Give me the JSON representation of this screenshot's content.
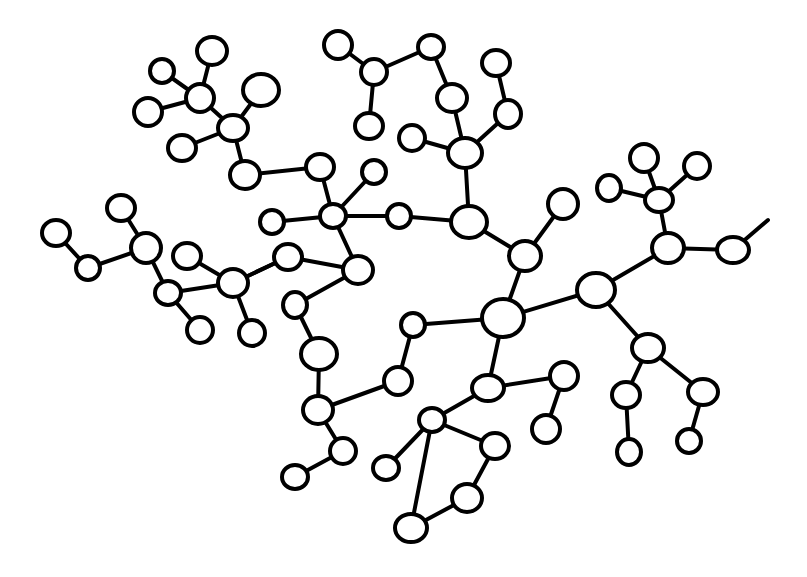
{
  "diagram": {
    "type": "hand-drawn network graph",
    "background": "#ffffff",
    "stroke_color": "#000000",
    "nodes": [
      {
        "id": 0,
        "x": 503,
        "y": 318,
        "rx": 21,
        "ry": 19
      },
      {
        "id": 1,
        "x": 596,
        "y": 290,
        "rx": 19,
        "ry": 17
      },
      {
        "id": 2,
        "x": 525,
        "y": 256,
        "rx": 16,
        "ry": 15
      },
      {
        "id": 3,
        "x": 469,
        "y": 222,
        "rx": 18,
        "ry": 16
      },
      {
        "id": 4,
        "x": 465,
        "y": 153,
        "rx": 17,
        "ry": 15
      },
      {
        "id": 5,
        "x": 452,
        "y": 98,
        "rx": 15,
        "ry": 14
      },
      {
        "id": 6,
        "x": 431,
        "y": 47,
        "rx": 13,
        "ry": 12
      },
      {
        "id": 7,
        "x": 508,
        "y": 114,
        "rx": 13,
        "ry": 14
      },
      {
        "id": 8,
        "x": 496,
        "y": 63,
        "rx": 14,
        "ry": 13
      },
      {
        "id": 9,
        "x": 412,
        "y": 138,
        "rx": 13,
        "ry": 13
      },
      {
        "id": 10,
        "x": 563,
        "y": 204,
        "rx": 15,
        "ry": 15
      },
      {
        "id": 11,
        "x": 374,
        "y": 72,
        "rx": 13,
        "ry": 13
      },
      {
        "id": 12,
        "x": 338,
        "y": 45,
        "rx": 14,
        "ry": 14
      },
      {
        "id": 13,
        "x": 369,
        "y": 126,
        "rx": 14,
        "ry": 13
      },
      {
        "id": 14,
        "x": 399,
        "y": 216,
        "rx": 12,
        "ry": 12
      },
      {
        "id": 15,
        "x": 333,
        "y": 216,
        "rx": 13,
        "ry": 12
      },
      {
        "id": 16,
        "x": 374,
        "y": 172,
        "rx": 12,
        "ry": 12
      },
      {
        "id": 17,
        "x": 320,
        "y": 167,
        "rx": 14,
        "ry": 13
      },
      {
        "id": 18,
        "x": 245,
        "y": 175,
        "rx": 15,
        "ry": 14
      },
      {
        "id": 19,
        "x": 233,
        "y": 128,
        "rx": 15,
        "ry": 13
      },
      {
        "id": 20,
        "x": 200,
        "y": 98,
        "rx": 14,
        "ry": 14
      },
      {
        "id": 21,
        "x": 212,
        "y": 51,
        "rx": 15,
        "ry": 14
      },
      {
        "id": 22,
        "x": 162,
        "y": 71,
        "rx": 12,
        "ry": 12
      },
      {
        "id": 23,
        "x": 148,
        "y": 112,
        "rx": 14,
        "ry": 14
      },
      {
        "id": 24,
        "x": 182,
        "y": 148,
        "rx": 14,
        "ry": 13
      },
      {
        "id": 25,
        "x": 261,
        "y": 90,
        "rx": 18,
        "ry": 16
      },
      {
        "id": 26,
        "x": 272,
        "y": 222,
        "rx": 12,
        "ry": 12
      },
      {
        "id": 27,
        "x": 358,
        "y": 270,
        "rx": 15,
        "ry": 14
      },
      {
        "id": 28,
        "x": 288,
        "y": 257,
        "rx": 14,
        "ry": 13
      },
      {
        "id": 29,
        "x": 233,
        "y": 283,
        "rx": 15,
        "ry": 14
      },
      {
        "id": 30,
        "x": 295,
        "y": 305,
        "rx": 12,
        "ry": 13
      },
      {
        "id": 31,
        "x": 319,
        "y": 354,
        "rx": 18,
        "ry": 16
      },
      {
        "id": 32,
        "x": 318,
        "y": 410,
        "rx": 15,
        "ry": 14
      },
      {
        "id": 33,
        "x": 398,
        "y": 381,
        "rx": 14,
        "ry": 14
      },
      {
        "id": 34,
        "x": 413,
        "y": 325,
        "rx": 12,
        "ry": 12
      },
      {
        "id": 35,
        "x": 343,
        "y": 451,
        "rx": 13,
        "ry": 13
      },
      {
        "id": 36,
        "x": 295,
        "y": 477,
        "rx": 13,
        "ry": 12
      },
      {
        "id": 37,
        "x": 488,
        "y": 388,
        "rx": 16,
        "ry": 13
      },
      {
        "id": 38,
        "x": 564,
        "y": 376,
        "rx": 14,
        "ry": 14
      },
      {
        "id": 39,
        "x": 546,
        "y": 429,
        "rx": 14,
        "ry": 14
      },
      {
        "id": 40,
        "x": 432,
        "y": 420,
        "rx": 13,
        "ry": 12
      },
      {
        "id": 41,
        "x": 495,
        "y": 446,
        "rx": 14,
        "ry": 13
      },
      {
        "id": 42,
        "x": 467,
        "y": 498,
        "rx": 15,
        "ry": 14
      },
      {
        "id": 43,
        "x": 411,
        "y": 528,
        "rx": 16,
        "ry": 14
      },
      {
        "id": 44,
        "x": 386,
        "y": 468,
        "rx": 13,
        "ry": 12
      },
      {
        "id": 45,
        "x": 648,
        "y": 348,
        "rx": 16,
        "ry": 14
      },
      {
        "id": 46,
        "x": 626,
        "y": 395,
        "rx": 14,
        "ry": 13
      },
      {
        "id": 47,
        "x": 629,
        "y": 452,
        "rx": 12,
        "ry": 13
      },
      {
        "id": 48,
        "x": 703,
        "y": 392,
        "rx": 15,
        "ry": 13
      },
      {
        "id": 49,
        "x": 689,
        "y": 441,
        "rx": 12,
        "ry": 12
      },
      {
        "id": 50,
        "x": 668,
        "y": 248,
        "rx": 16,
        "ry": 15
      },
      {
        "id": 51,
        "x": 659,
        "y": 200,
        "rx": 14,
        "ry": 12
      },
      {
        "id": 52,
        "x": 644,
        "y": 158,
        "rx": 14,
        "ry": 14
      },
      {
        "id": 53,
        "x": 697,
        "y": 166,
        "rx": 13,
        "ry": 13
      },
      {
        "id": 54,
        "x": 609,
        "y": 188,
        "rx": 12,
        "ry": 13
      },
      {
        "id": 55,
        "x": 733,
        "y": 250,
        "rx": 16,
        "ry": 13
      },
      {
        "id": 56,
        "x": 146,
        "y": 248,
        "rx": 15,
        "ry": 15
      },
      {
        "id": 57,
        "x": 121,
        "y": 208,
        "rx": 14,
        "ry": 13
      },
      {
        "id": 58,
        "x": 88,
        "y": 268,
        "rx": 12,
        "ry": 12
      },
      {
        "id": 59,
        "x": 56,
        "y": 233,
        "rx": 14,
        "ry": 13
      },
      {
        "id": 60,
        "x": 168,
        "y": 293,
        "rx": 13,
        "ry": 12
      },
      {
        "id": 61,
        "x": 187,
        "y": 256,
        "rx": 14,
        "ry": 13
      },
      {
        "id": 62,
        "x": 200,
        "y": 330,
        "rx": 13,
        "ry": 13
      },
      {
        "id": 63,
        "x": 252,
        "y": 333,
        "rx": 13,
        "ry": 13
      }
    ],
    "edges": [
      [
        0,
        1
      ],
      [
        0,
        2
      ],
      [
        2,
        10
      ],
      [
        2,
        3
      ],
      [
        3,
        4
      ],
      [
        4,
        5
      ],
      [
        5,
        6
      ],
      [
        6,
        11
      ],
      [
        4,
        7
      ],
      [
        7,
        8
      ],
      [
        4,
        9
      ],
      [
        11,
        12
      ],
      [
        11,
        13
      ],
      [
        3,
        14
      ],
      [
        14,
        15
      ],
      [
        15,
        16
      ],
      [
        15,
        17
      ],
      [
        17,
        18
      ],
      [
        18,
        19
      ],
      [
        19,
        20
      ],
      [
        20,
        21
      ],
      [
        20,
        22
      ],
      [
        20,
        23
      ],
      [
        19,
        24
      ],
      [
        19,
        25
      ],
      [
        15,
        26
      ],
      [
        15,
        27
      ],
      [
        27,
        28
      ],
      [
        28,
        29
      ],
      [
        27,
        30
      ],
      [
        30,
        31
      ],
      [
        31,
        32
      ],
      [
        32,
        33
      ],
      [
        33,
        34
      ],
      [
        34,
        0
      ],
      [
        32,
        35
      ],
      [
        35,
        36
      ],
      [
        0,
        37
      ],
      [
        37,
        38
      ],
      [
        38,
        39
      ],
      [
        37,
        40
      ],
      [
        40,
        41
      ],
      [
        41,
        42
      ],
      [
        42,
        43
      ],
      [
        43,
        40
      ],
      [
        40,
        44
      ],
      [
        1,
        45
      ],
      [
        45,
        46
      ],
      [
        46,
        47
      ],
      [
        45,
        48
      ],
      [
        48,
        49
      ],
      [
        1,
        50
      ],
      [
        50,
        51
      ],
      [
        51,
        52
      ],
      [
        51,
        53
      ],
      [
        51,
        54
      ],
      [
        50,
        55
      ],
      [
        29,
        61
      ],
      [
        29,
        60
      ],
      [
        60,
        56
      ],
      [
        56,
        57
      ],
      [
        56,
        58
      ],
      [
        58,
        59
      ],
      [
        60,
        62
      ],
      [
        29,
        63
      ],
      [
        29,
        28
      ]
    ],
    "dangling_edges": [
      {
        "from": 55,
        "x2": 768,
        "y2": 220
      }
    ]
  }
}
